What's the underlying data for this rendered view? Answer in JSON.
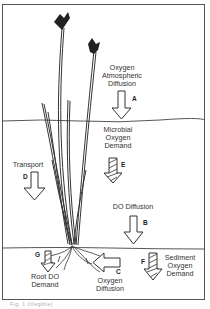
{
  "diagram": {
    "processes": {
      "A": {
        "letter": "A",
        "line1": "Oxygen",
        "line2": "Atmospheric",
        "line3": "Diffusion"
      },
      "B": {
        "letter": "B",
        "line1": "DO Diffusion"
      },
      "C": {
        "letter": "C",
        "line1": "Oxygen",
        "line2": "Diffusion"
      },
      "D": {
        "letter": "D",
        "line1": "Transport"
      },
      "E": {
        "letter": "E",
        "line1": "Microbial",
        "line2": "Oxygen",
        "line3": "Demand"
      },
      "F": {
        "letter": "F",
        "line1": "Sediment",
        "line2": "Oxygen",
        "line3": "Demand"
      },
      "G": {
        "letter": "G",
        "line1": "Root DO",
        "line2": "Demand"
      }
    },
    "caption": "Fig. 1 (illegible)",
    "colors": {
      "line": "#333333",
      "background": "#ffffff"
    }
  }
}
